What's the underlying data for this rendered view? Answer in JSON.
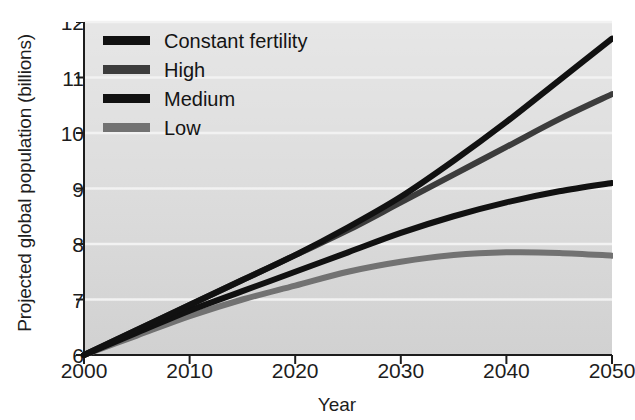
{
  "chart_data": {
    "type": "line",
    "title": "",
    "xlabel": "Year",
    "ylabel": "Projected global population (billions)",
    "xlim": [
      2000,
      2050
    ],
    "ylim": [
      6,
      12
    ],
    "xticks": [
      "2000",
      "2010",
      "2020",
      "2030",
      "2040",
      "2050"
    ],
    "yticks": [
      "6",
      "7",
      "8",
      "9",
      "10",
      "11",
      "12"
    ],
    "grid": "horizontal-white",
    "legend_position": "top-left-inside",
    "x": [
      2000,
      2005,
      2010,
      2015,
      2020,
      2025,
      2030,
      2035,
      2040,
      2045,
      2050
    ],
    "series": [
      {
        "name": "Constant fertility",
        "color": "#111111",
        "values": [
          6.0,
          6.45,
          6.9,
          7.35,
          7.8,
          8.3,
          8.85,
          9.5,
          10.2,
          10.95,
          11.7
        ]
      },
      {
        "name": "High",
        "color": "#3c3c3c",
        "values": [
          6.0,
          6.45,
          6.9,
          7.35,
          7.8,
          8.25,
          8.75,
          9.25,
          9.75,
          10.25,
          10.7
        ]
      },
      {
        "name": "Medium",
        "color": "#111111",
        "values": [
          6.0,
          6.4,
          6.8,
          7.15,
          7.5,
          7.85,
          8.2,
          8.5,
          8.75,
          8.95,
          9.1
        ]
      },
      {
        "name": "Low",
        "color": "#727272",
        "values": [
          6.0,
          6.35,
          6.7,
          7.0,
          7.25,
          7.5,
          7.68,
          7.8,
          7.85,
          7.84,
          7.79
        ]
      }
    ]
  },
  "legend": {
    "items": [
      {
        "label": "Constant fertility",
        "color": "#111111"
      },
      {
        "label": "High",
        "color": "#3c3c3c"
      },
      {
        "label": "Medium",
        "color": "#111111"
      },
      {
        "label": "Low",
        "color": "#727272"
      }
    ]
  },
  "axes": {
    "x_axis_label": "Year",
    "y_axis_label": "Projected global population (billions)"
  },
  "style": {
    "plot_background": "#dcdcdc",
    "gridline_color": "#f2f2f2",
    "axis_color": "#1d1d1d",
    "page_background": "#ffffff"
  }
}
